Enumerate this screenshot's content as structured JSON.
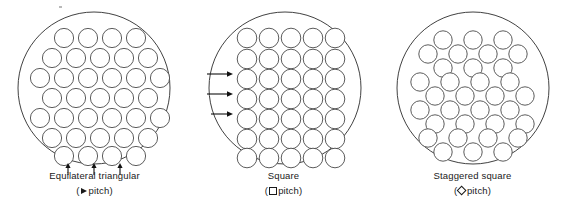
{
  "figure": {
    "background_color": "#ffffff",
    "line_color": "#2b2b2b",
    "tube_stroke_color": "#4a4a4a"
  },
  "panels": [
    {
      "id": "equilateral-triangular",
      "caption_title": "Equilateral triangular",
      "pitch_open_paren": "(",
      "pitch_symbol": "triangle-right",
      "pitch_label": "pitch",
      "pitch_close_paren": ")",
      "shell": {
        "cx": 94,
        "cy": 88,
        "r": 76
      },
      "tube_radius": 9.6,
      "rows": [
        {
          "y": 38,
          "xs": [
            64,
            88,
            112,
            136
          ]
        },
        {
          "y": 58,
          "xs": [
            52,
            76,
            100,
            124,
            148
          ]
        },
        {
          "y": 78,
          "xs": [
            40,
            64,
            88,
            112,
            136,
            160
          ]
        },
        {
          "y": 98,
          "xs": [
            52,
            76,
            100,
            124,
            148
          ]
        },
        {
          "y": 118,
          "xs": [
            40,
            64,
            88,
            112,
            136,
            160
          ]
        },
        {
          "y": 138,
          "xs": [
            52,
            76,
            100,
            124,
            148
          ]
        },
        {
          "y": 156,
          "xs": [
            64,
            88,
            112,
            136
          ]
        }
      ],
      "arrows": {
        "direction": "up",
        "count": 3,
        "items": [
          {
            "x": 68,
            "y_start": 175,
            "y_end": 163
          },
          {
            "x": 94,
            "y_start": 177,
            "y_end": 163
          },
          {
            "x": 120,
            "y_start": 175,
            "y_end": 163
          }
        ]
      }
    },
    {
      "id": "square",
      "caption_title": "Square",
      "pitch_open_paren": "(",
      "pitch_symbol": "square",
      "pitch_label": "pitch",
      "pitch_close_paren": ")",
      "shell": {
        "cx": 96,
        "cy": 88,
        "r": 76
      },
      "tube_radius": 9.8,
      "rows": [
        {
          "y": 38,
          "xs": [
            58,
            80,
            102,
            124,
            146
          ]
        },
        {
          "y": 59,
          "xs": [
            58,
            80,
            102,
            124,
            146
          ]
        },
        {
          "y": 79,
          "xs": [
            58,
            80,
            102,
            124,
            146
          ]
        },
        {
          "y": 99,
          "xs": [
            58,
            80,
            102,
            124,
            146
          ]
        },
        {
          "y": 119,
          "xs": [
            58,
            80,
            102,
            124,
            146
          ]
        },
        {
          "y": 139,
          "xs": [
            58,
            80,
            102,
            124,
            146
          ]
        },
        {
          "y": 158,
          "xs": [
            58,
            80,
            102,
            124,
            146
          ]
        }
      ],
      "arrows": {
        "direction": "right",
        "count": 3,
        "items": [
          {
            "y": 74,
            "x_start": 18,
            "x_end": 44
          },
          {
            "y": 94,
            "x_start": 18,
            "x_end": 44
          },
          {
            "y": 114,
            "x_start": 22,
            "x_end": 44
          }
        ]
      }
    },
    {
      "id": "staggered-square",
      "caption_title": "Staggered square",
      "pitch_open_paren": "(",
      "pitch_symbol": "diamond",
      "pitch_label": "pitch",
      "pitch_close_paren": ")",
      "shell": {
        "cx": 95,
        "cy": 88,
        "r": 76
      },
      "tube_radius": 9.2,
      "rows": [
        {
          "y": 40,
          "xs": [
            65,
            95,
            125
          ]
        },
        {
          "y": 54,
          "xs": [
            50,
            80,
            110,
            140
          ]
        },
        {
          "y": 68,
          "xs": [
            65,
            95,
            125
          ]
        },
        {
          "y": 82,
          "xs": [
            42,
            72,
            102,
            132
          ]
        },
        {
          "y": 96,
          "xs": [
            57,
            87,
            117,
            147
          ]
        },
        {
          "y": 110,
          "xs": [
            42,
            72,
            102,
            132
          ]
        },
        {
          "y": 124,
          "xs": [
            57,
            87,
            117,
            147
          ]
        },
        {
          "y": 138,
          "xs": [
            50,
            80,
            110,
            140
          ]
        },
        {
          "y": 152,
          "xs": [
            65,
            95,
            125
          ]
        }
      ],
      "arrows": {
        "direction": "none",
        "count": 0,
        "items": []
      }
    }
  ]
}
